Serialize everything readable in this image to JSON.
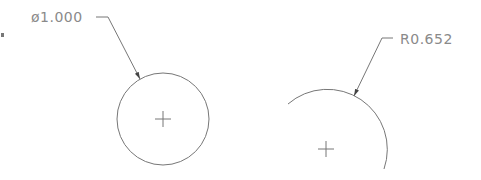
{
  "drawing": {
    "stroke_color": "#777777",
    "text_color": "#8a8a8a",
    "background": "#ffffff",
    "left_feature": {
      "type": "circle",
      "dimension_label": "ø1.000",
      "dimension_kind": "diameter",
      "center": [
        163,
        119
      ],
      "radius": 46,
      "label_pos": [
        31,
        9
      ],
      "leader": [
        [
          96,
          17
        ],
        [
          108,
          17
        ],
        [
          140,
          79
        ]
      ]
    },
    "right_feature": {
      "type": "arc",
      "dimension_label": "R0.652",
      "dimension_kind": "radius",
      "center": [
        326,
        149
      ],
      "radius": 60,
      "label_pos": [
        400,
        32
      ],
      "leader": [
        [
          393,
          38
        ],
        [
          382,
          38
        ],
        [
          354,
          96
        ]
      ]
    }
  }
}
